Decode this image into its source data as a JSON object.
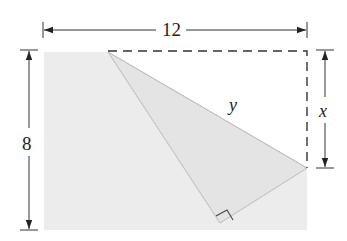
{
  "figure": {
    "labels": {
      "width": "12",
      "height": "8",
      "corner_drop": "x",
      "crease": "y"
    },
    "colors": {
      "paper_fill": "#ececec",
      "flap_fill": "#e6e6e6",
      "line": "#333333",
      "edge": "#c8c8c8"
    },
    "geometry": {
      "rectangle": {
        "left": 44,
        "top": 50,
        "right": 307,
        "bottom": 230
      },
      "fold_top_point": [
        108,
        52
      ],
      "fold_right_point": [
        307,
        168
      ],
      "folded_corner": [
        220,
        223
      ],
      "crease_bottom": [
        228,
        230
      ]
    }
  }
}
